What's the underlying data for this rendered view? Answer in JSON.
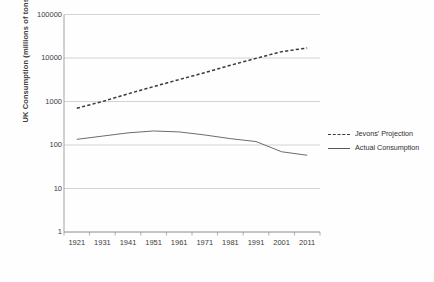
{
  "chart_data": {
    "type": "line",
    "title": "",
    "xlabel": "",
    "ylabel": "UK Consumption (millions of tons)",
    "x": [
      1921,
      1931,
      1941,
      1951,
      1961,
      1971,
      1981,
      1991,
      2001,
      2011
    ],
    "xtick_labels": [
      "1921",
      "1931",
      "1941",
      "1951",
      "1961",
      "1971",
      "1981",
      "1991",
      "2001",
      "2011"
    ],
    "ytick_labels": [
      "100000",
      "10000",
      "1000",
      "100",
      "10",
      "1"
    ],
    "ytick_values": [
      100000,
      10000,
      1000,
      100,
      10,
      1
    ],
    "yscale": "log",
    "ylim": [
      1,
      100000
    ],
    "grid": true,
    "legend_position": "right",
    "series": [
      {
        "name": "Jevons' Projection",
        "style": "dashed",
        "color": "#3a3a3a",
        "values": [
          700,
          1000,
          1500,
          2200,
          3200,
          4600,
          6800,
          9800,
          14000,
          17000
        ]
      },
      {
        "name": "Actual Consumption",
        "style": "solid",
        "color": "#6b6b6b",
        "values": [
          135,
          160,
          190,
          210,
          200,
          170,
          140,
          120,
          70,
          58
        ]
      }
    ]
  },
  "legend": {
    "items": [
      {
        "label": "Jevons' Projection",
        "style": "dashed"
      },
      {
        "label": "Actual Consumption",
        "style": "solid"
      }
    ]
  },
  "axes": {
    "y_axis_title": "UK Consumption (millions of tons)"
  },
  "colors": {
    "background": "#fefefe",
    "grid": "#c8c8c8",
    "axis": "#9a9a9a",
    "text": "#3b3b3b",
    "projection_line": "#3a3a3a",
    "actual_line": "#6b6b6b"
  },
  "watermark": {
    "mark": "·"
  }
}
